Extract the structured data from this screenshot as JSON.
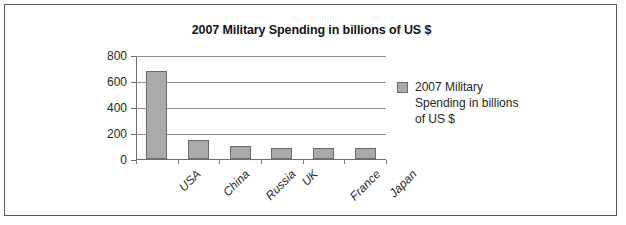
{
  "chart_data": {
    "type": "bar",
    "title": "2007 Military Spending in billions of US $",
    "xlabel": "",
    "ylabel": "",
    "categories": [
      "USA",
      "China",
      "Russia",
      "UK",
      "France",
      "Japan"
    ],
    "values": [
      680,
      150,
      100,
      85,
      88,
      88
    ],
    "series": [
      {
        "name": "2007 Military Spending in billions of US $",
        "values": [
          680,
          150,
          100,
          85,
          88,
          88
        ]
      }
    ],
    "ylim": [
      0,
      800
    ],
    "yticks": [
      "0",
      "200",
      "400",
      "600",
      "800"
    ],
    "ytick_values": [
      0,
      200,
      400,
      600,
      800
    ],
    "grid": true,
    "legend_position": "right",
    "bar_color": "#aaaaaa",
    "bar_border_color": "#6b6b6b",
    "gridline_color": "#8d8d8d",
    "axis_color": "#6e6e6e"
  },
  "legend": {
    "entries": [
      {
        "label": "2007 Military Spending in billions of US $",
        "color": "#aaaaaa"
      }
    ]
  }
}
